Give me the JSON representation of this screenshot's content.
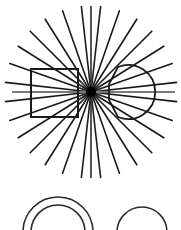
{
  "figure": {
    "width": 181,
    "height": 230,
    "background": "#ffffff",
    "stroke_color": "#1a1a1a",
    "axis_color": "#7a7a7a"
  },
  "starburst": {
    "center": [
      91,
      92
    ],
    "ray_count": 28,
    "ray_length": 86,
    "stroke_width": 1.6,
    "hub_radius": 5
  },
  "horizontal_axis": {
    "x1": 12,
    "x2": 175,
    "y": 92
  },
  "vertical_axis": {
    "x": 91,
    "y1": 6,
    "y2": 178
  },
  "rectangle": {
    "x": 31,
    "y": 69,
    "width": 47,
    "height": 48
  },
  "right_circle": {
    "cx": 128,
    "cy": 92,
    "r": 27,
    "flat_x": 109,
    "flat_y1": 84,
    "flat_y2": 100
  },
  "bottom_shapes": {
    "double_arc": {
      "cx": 58,
      "cy": 232,
      "r_outer": 35,
      "r_inner": 27
    },
    "single_arc": {
      "cx": 142,
      "cy": 232,
      "r": 25
    }
  }
}
